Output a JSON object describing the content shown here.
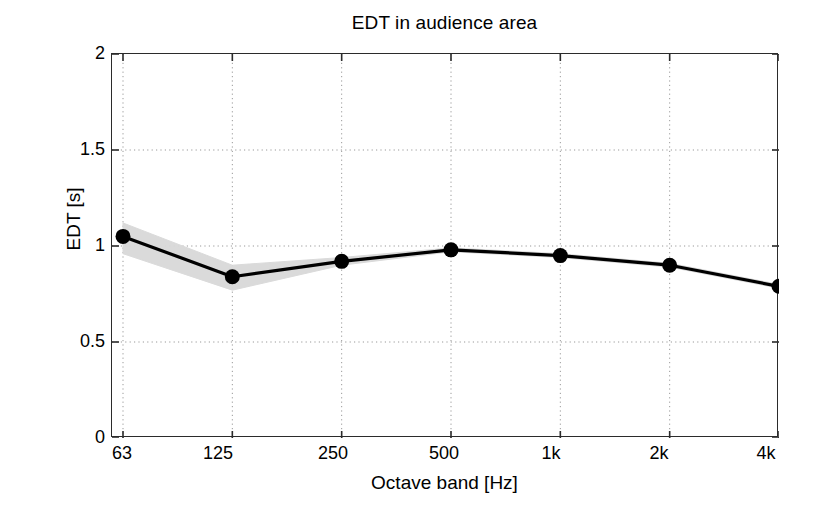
{
  "chart_data": {
    "type": "line",
    "title": "EDT in audience area",
    "xlabel": "Octave band [Hz]",
    "ylabel": "EDT [s]",
    "categories": [
      "63",
      "125",
      "250",
      "500",
      "1k",
      "2k",
      "4k"
    ],
    "xtick_labels": [
      "63",
      "125",
      "250",
      "500",
      "1k",
      "2k",
      "4k"
    ],
    "ytick_labels": [
      "0",
      "0.5",
      "1",
      "1.5",
      "2"
    ],
    "ytick_values": [
      0,
      0.5,
      1,
      1.5,
      2
    ],
    "ylim": [
      0,
      2
    ],
    "grid": "dotted-both",
    "legend": "none",
    "series": [
      {
        "name": "EDT mean",
        "marker": "filled-circle",
        "color": "#000000",
        "values": [
          1.05,
          0.84,
          0.92,
          0.98,
          0.95,
          0.9,
          0.79
        ]
      }
    ],
    "band": {
      "name": "spatial spread",
      "color": "#d9d9d9",
      "upper": [
        1.12,
        0.9,
        0.94,
        0.99,
        0.96,
        0.91,
        0.8
      ],
      "lower": [
        0.96,
        0.77,
        0.9,
        0.97,
        0.94,
        0.89,
        0.78
      ]
    },
    "colors": {
      "axis": "#2b2b2b",
      "grid": "#999999",
      "line": "#000000",
      "band": "#d9d9d9",
      "background": "#ffffff"
    }
  }
}
